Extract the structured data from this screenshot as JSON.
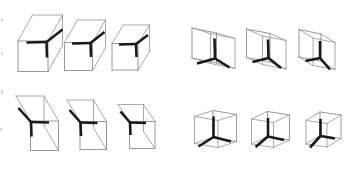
{
  "figure": {
    "background_color": "#ffffff",
    "wire_color": "#9a9a9a",
    "vertex_color": "#1a1a1a",
    "width": 352,
    "height": 173,
    "group_count": 4,
    "items_per_group": 3,
    "total_items": 12
  },
  "groups": [
    {
      "id": "group-top-left",
      "label": "",
      "position": "top-left",
      "view": "above-left",
      "items": [
        {
          "id": "box-1",
          "label": "",
          "vertex": {
            "x": 46.5,
            "y": 42.0
          },
          "arms": [
            {
              "name": "arm-up-right",
              "dx": 16.0,
              "dy": -12.5
            },
            {
              "name": "arm-left",
              "dx": -20.0,
              "dy": 0.5
            },
            {
              "name": "arm-down",
              "dx": 0.5,
              "dy": 15.5
            }
          ],
          "box": {
            "front": [
              [
                18.0,
                41.0
              ],
              [
                18.0,
                71.5
              ],
              [
                48.0,
                71.5
              ],
              [
                48.0,
                41.0
              ]
            ],
            "top_back": [
              [
                32.5,
                15.0
              ],
              [
                62.5,
                15.0
              ]
            ],
            "depth": {
              "dx": 14.5,
              "dy": -26.0
            }
          }
        },
        {
          "id": "box-2",
          "label": "",
          "vertex": {
            "x": 90.5,
            "y": 43.0
          },
          "arms": [
            {
              "name": "arm-up-right",
              "dx": 14.0,
              "dy": -11.0
            },
            {
              "name": "arm-left",
              "dx": -18.5,
              "dy": 0.5
            },
            {
              "name": "arm-down",
              "dx": 0.5,
              "dy": 14.0
            }
          ],
          "box": {
            "front": [
              [
                64.5,
                42.5
              ],
              [
                64.5,
                70.5
              ],
              [
                92.5,
                70.5
              ],
              [
                92.5,
                42.5
              ]
            ],
            "top_back": [
              [
                77.5,
                20.0
              ],
              [
                105.5,
                20.0
              ]
            ],
            "depth": {
              "dx": 13.0,
              "dy": -22.5
            }
          }
        },
        {
          "id": "box-3",
          "label": "",
          "vertex": {
            "x": 136.0,
            "y": 44.0
          },
          "arms": [
            {
              "name": "arm-up-right",
              "dx": 12.0,
              "dy": -9.0
            },
            {
              "name": "arm-left",
              "dx": -17.0,
              "dy": 0.5
            },
            {
              "name": "arm-down",
              "dx": 0.5,
              "dy": 13.0
            }
          ],
          "box": {
            "front": [
              [
                112.0,
                43.5
              ],
              [
                112.0,
                70.0
              ],
              [
                138.0,
                70.0
              ],
              [
                138.0,
                43.5
              ]
            ],
            "top_back": [
              [
                123.5,
                25.0
              ],
              [
                149.5,
                25.0
              ]
            ],
            "depth": {
              "dx": 11.5,
              "dy": -18.5
            }
          }
        }
      ]
    },
    {
      "id": "group-top-right",
      "label": "",
      "position": "top-right",
      "view": "below-left",
      "items": [
        {
          "id": "box-4",
          "label": "",
          "vertex": {
            "x": 215.0,
            "y": 58.5
          },
          "arms": [
            {
              "name": "arm-up",
              "dx": -0.5,
              "dy": -20.0
            },
            {
              "name": "arm-left-down",
              "dx": -18.0,
              "dy": 5.0
            },
            {
              "name": "arm-right-down",
              "dx": 14.5,
              "dy": 9.0
            }
          ],
          "box": {
            "front": [
              [
                192.0,
                28.0
              ],
              [
                192.0,
                58.0
              ],
              [
                216.5,
                63.0
              ],
              [
                216.5,
                33.0
              ]
            ],
            "back_shift": {
              "dx": 18.5,
              "dy": 5.5
            }
          }
        },
        {
          "id": "box-5",
          "label": "",
          "vertex": {
            "x": 268.5,
            "y": 58.0
          },
          "arms": [
            {
              "name": "arm-up",
              "dx": -0.5,
              "dy": -18.5
            },
            {
              "name": "arm-left-down",
              "dx": -16.0,
              "dy": 4.0
            },
            {
              "name": "arm-right-down",
              "dx": 12.5,
              "dy": 10.0
            }
          ],
          "box": {
            "front": [
              [
                246.5,
                29.0
              ],
              [
                246.5,
                57.5
              ],
              [
                270.0,
                62.0
              ],
              [
                270.0,
                33.5
              ]
            ],
            "back_shift": {
              "dx": 16.0,
              "dy": 7.0
            }
          }
        },
        {
          "id": "box-6",
          "label": "",
          "vertex": {
            "x": 320.0,
            "y": 58.0
          },
          "arms": [
            {
              "name": "arm-up",
              "dx": 0.0,
              "dy": -17.0
            },
            {
              "name": "arm-left-down",
              "dx": -14.5,
              "dy": 3.0
            },
            {
              "name": "arm-right-down",
              "dx": 10.0,
              "dy": 11.5
            }
          ],
          "box": {
            "front": [
              [
                299.0,
                29.5
              ],
              [
                299.0,
                57.0
              ],
              [
                321.0,
                61.0
              ],
              [
                321.0,
                34.0
              ]
            ],
            "back_shift": {
              "dx": 14.0,
              "dy": 8.5
            }
          }
        }
      ]
    },
    {
      "id": "group-bottom-left",
      "label": "",
      "position": "bottom-left",
      "view": "above-right",
      "items": [
        {
          "id": "box-7",
          "label": "",
          "vertex": {
            "x": 31.0,
            "y": 122.0
          },
          "arms": [
            {
              "name": "arm-up-left",
              "dx": -12.5,
              "dy": -14.0
            },
            {
              "name": "arm-right",
              "dx": 18.0,
              "dy": 0.5
            },
            {
              "name": "arm-down",
              "dx": 0.5,
              "dy": 14.5
            }
          ],
          "box": {
            "front": [
              [
                30.5,
                121.0
              ],
              [
                30.5,
                150.5
              ],
              [
                58.5,
                150.5
              ],
              [
                58.5,
                121.0
              ]
            ],
            "top_back": [
              [
                16.0,
                96.0
              ],
              [
                44.0,
                96.0
              ]
            ],
            "depth": {
              "dx": -14.5,
              "dy": -25.0
            }
          }
        },
        {
          "id": "box-8",
          "label": "",
          "vertex": {
            "x": 80.5,
            "y": 122.5
          },
          "arms": [
            {
              "name": "arm-up-left",
              "dx": -11.0,
              "dy": -12.5
            },
            {
              "name": "arm-right",
              "dx": 17.0,
              "dy": 0.5
            },
            {
              "name": "arm-down",
              "dx": 0.5,
              "dy": 13.5
            }
          ],
          "box": {
            "front": [
              [
                80.0,
                121.5
              ],
              [
                80.0,
                149.5
              ],
              [
                106.5,
                149.5
              ],
              [
                106.5,
                121.5
              ]
            ],
            "top_back": [
              [
                67.0,
                100.0
              ],
              [
                93.5,
                100.0
              ]
            ],
            "depth": {
              "dx": -13.0,
              "dy": -21.5
            }
          }
        },
        {
          "id": "box-9",
          "label": "",
          "vertex": {
            "x": 130.0,
            "y": 122.5
          },
          "arms": [
            {
              "name": "arm-up-left",
              "dx": -9.5,
              "dy": -11.0
            },
            {
              "name": "arm-right",
              "dx": 16.0,
              "dy": 0.5
            },
            {
              "name": "arm-down",
              "dx": 0.5,
              "dy": 12.5
            }
          ],
          "box": {
            "front": [
              [
                129.5,
                121.5
              ],
              [
                129.5,
                148.5
              ],
              [
                155.0,
                148.5
              ],
              [
                155.0,
                121.5
              ]
            ],
            "top_back": [
              [
                118.0,
                104.5
              ],
              [
                143.5,
                104.5
              ]
            ],
            "depth": {
              "dx": -11.5,
              "dy": -17.0
            }
          }
        }
      ]
    },
    {
      "id": "group-bottom-right",
      "label": "",
      "position": "bottom-right",
      "view": "below-right",
      "items": [
        {
          "id": "box-10",
          "label": "",
          "vertex": {
            "x": 213.5,
            "y": 137.0
          },
          "arms": [
            {
              "name": "arm-up",
              "dx": 0.0,
              "dy": -20.5
            },
            {
              "name": "arm-left-down",
              "dx": -15.0,
              "dy": 9.5
            },
            {
              "name": "arm-right",
              "dx": 17.5,
              "dy": 4.5
            }
          ],
          "box": {
            "front": [
              [
                213.0,
                110.5
              ],
              [
                213.0,
                137.5
              ],
              [
                236.5,
                141.5
              ],
              [
                236.5,
                114.5
              ]
            ],
            "back_shift": {
              "dx": -18.5,
              "dy": 6.0
            }
          }
        },
        {
          "id": "box-11",
          "label": "",
          "vertex": {
            "x": 268.0,
            "y": 136.5
          },
          "arms": [
            {
              "name": "arm-up",
              "dx": 0.0,
              "dy": -18.5
            },
            {
              "name": "arm-left-down",
              "dx": -12.5,
              "dy": 10.5
            },
            {
              "name": "arm-right",
              "dx": 16.0,
              "dy": 3.5
            }
          ],
          "box": {
            "front": [
              [
                267.5,
                111.5
              ],
              [
                267.5,
                136.5
              ],
              [
                289.5,
                140.0
              ],
              [
                289.5,
                115.0
              ]
            ],
            "back_shift": {
              "dx": -16.0,
              "dy": 7.5
            }
          }
        },
        {
          "id": "box-12",
          "label": "",
          "vertex": {
            "x": 320.5,
            "y": 136.0
          },
          "arms": [
            {
              "name": "arm-up",
              "dx": 0.0,
              "dy": -17.0
            },
            {
              "name": "arm-left-down",
              "dx": -10.5,
              "dy": 11.5
            },
            {
              "name": "arm-right",
              "dx": 14.5,
              "dy": 2.5
            }
          ],
          "box": {
            "front": [
              [
                320.0,
                112.0
              ],
              [
                320.0,
                135.5
              ],
              [
                341.0,
                138.5
              ],
              [
                341.0,
                115.0
              ]
            ],
            "back_shift": {
              "dx": -14.0,
              "dy": 8.5
            }
          }
        }
      ]
    }
  ],
  "scan_artifacts": [
    {
      "name": "edge-speck-1",
      "x": 1,
      "y": 18,
      "w": 2,
      "h": 3
    },
    {
      "name": "edge-speck-2",
      "x": 1,
      "y": 52,
      "w": 2,
      "h": 3
    },
    {
      "name": "edge-speck-3",
      "x": 1,
      "y": 90,
      "w": 2,
      "h": 4
    },
    {
      "name": "edge-speck-4",
      "x": 0,
      "y": 128,
      "w": 2,
      "h": 3
    }
  ]
}
